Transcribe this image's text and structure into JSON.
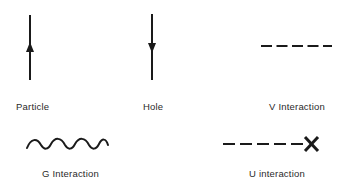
{
  "diagram": {
    "items": [
      {
        "id": "particle",
        "label": "Particle",
        "symbol": "upward-arrow-line"
      },
      {
        "id": "hole",
        "label": "Hole",
        "symbol": "downward-arrow-line"
      },
      {
        "id": "v_interaction",
        "label": "V Interaction",
        "symbol": "dashed-line"
      },
      {
        "id": "g_interaction",
        "label": "G Interaction",
        "symbol": "wavy-line"
      },
      {
        "id": "u_interaction",
        "label": "U interaction",
        "symbol": "dashed-line-with-x"
      }
    ],
    "colors": {
      "stroke": "#1a1a1a",
      "background": "#ffffff"
    }
  }
}
